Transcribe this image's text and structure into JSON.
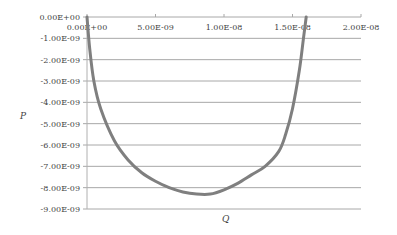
{
  "chart_data": {
    "type": "line",
    "title": "",
    "xlabel": "Q",
    "ylabel": "P",
    "xlim": [
      0,
      2e-08
    ],
    "ylim": [
      -9e-09,
      0
    ],
    "x_tick_labels": [
      "0.00E+00",
      "5.00E-09",
      "1.00E-08",
      "1.50E-08",
      "2.00E-08"
    ],
    "y_tick_labels": [
      "0.00E+00",
      "-1.00E-09",
      "-2.00E-09",
      "-3.00E-09",
      "-4.00E-09",
      "-5.00E-09",
      "-6.00E-09",
      "-7.00E-09",
      "-8.00E-09",
      "-9.00E-09"
    ],
    "grid": "horizontal",
    "legend": "none",
    "series": [
      {
        "name": "P vs Q",
        "color": "#7f7f7f",
        "x": [
          0.0,
          2e-10,
          5e-10,
          1e-09,
          2e-09,
          3e-09,
          4e-09,
          5e-09,
          6e-09,
          7e-09,
          8e-09,
          9e-09,
          1e-08,
          1.1e-08,
          1.2e-08,
          1.3e-08,
          1.4e-08,
          1.45e-08,
          1.5e-08,
          1.55e-08,
          1.58e-08,
          1.6e-08
        ],
        "y": [
          0.0,
          -1.5e-09,
          -3e-09,
          -4.3e-09,
          -5.8e-09,
          -6.7e-09,
          -7.3e-09,
          -7.7e-09,
          -8e-09,
          -8.2e-09,
          -8.3e-09,
          -8.3e-09,
          -8.1e-09,
          -7.8e-09,
          -7.4e-09,
          -7e-09,
          -6.3e-09,
          -5.5e-09,
          -4.3e-09,
          -2.5e-09,
          -1e-09,
          0.0
        ]
      }
    ]
  }
}
